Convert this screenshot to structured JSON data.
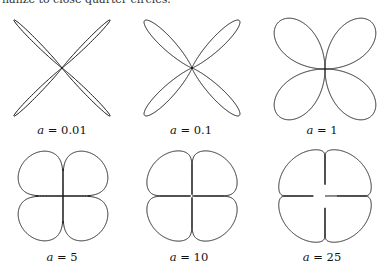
{
  "caption_fragment": "nalize to close quarter circles.",
  "stroke_color": "#1a1a1a",
  "panels": [
    {
      "label_var": "a",
      "label_value": "0.01",
      "a": 0.01,
      "cx": 62,
      "cy": 68,
      "R": 68,
      "lx": 62,
      "ly": 123
    },
    {
      "label_var": "a",
      "label_value": "0.1",
      "a": 0.1,
      "cx": 192,
      "cy": 68,
      "R": 67,
      "lx": 191,
      "ly": 123
    },
    {
      "label_var": "a",
      "label_value": "1",
      "a": 1,
      "cx": 325,
      "cy": 69,
      "R": 66,
      "lx": 322,
      "ly": 123
    },
    {
      "label_var": "a",
      "label_value": "5",
      "a": 5,
      "cx": 63,
      "cy": 196,
      "R": 52,
      "lx": 62,
      "ly": 250
    },
    {
      "label_var": "a",
      "label_value": "10",
      "a": 10,
      "cx": 192,
      "cy": 196,
      "R": 50,
      "lx": 189,
      "ly": 250
    },
    {
      "label_var": "a",
      "label_value": "25",
      "a": 25,
      "cx": 325,
      "cy": 196,
      "R": 49,
      "lx": 322,
      "ly": 250
    }
  ]
}
